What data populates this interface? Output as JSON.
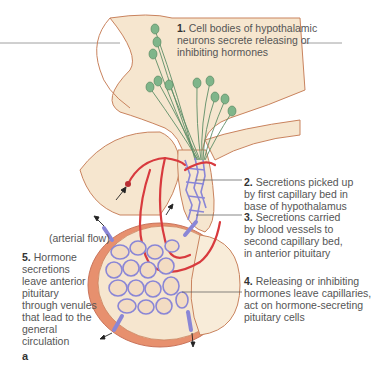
{
  "diagram": {
    "panel_label": "a",
    "annotations": [
      {
        "number": "1.",
        "text": "Cell bodies of hypothalamic\nneurons secrete releasing or\ninhibiting hormones"
      },
      {
        "number": "2.",
        "text": "Secretions picked up\nby first capillary bed in\nbase of hypothalamus"
      },
      {
        "number": "3.",
        "text": "Secretions carried\nby blood vessels to\nsecond capillary bed,\nin anterior pituitary"
      },
      {
        "number": "4.",
        "text": "Releasing or inhibiting\nhormones leave capillaries,\nact on hormone-secreting\npituitary cells"
      },
      {
        "number": "5.",
        "text": "Hormone\nsecretions\nleave anterior\npituitary\nthrough venules\nthat lead to the\ngeneral\ncirculation"
      }
    ],
    "flow_label": "(arterial flow)",
    "colors": {
      "tissue": "#f6e6cf",
      "tissue_outline": "#c9835e",
      "pituitary_rim": "#d9785a",
      "neuron": "#6fa77a",
      "artery": "#d83a3e",
      "capillary": "#8a86d6",
      "label_text": "#555555",
      "leader_line": "#555555"
    }
  }
}
